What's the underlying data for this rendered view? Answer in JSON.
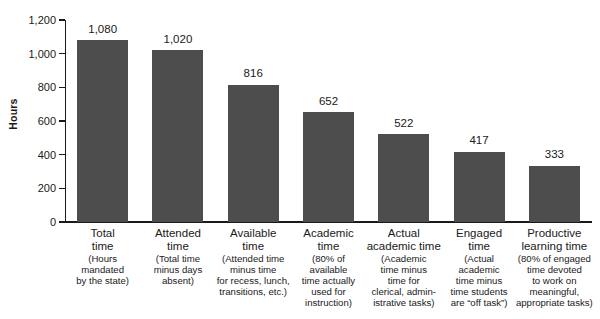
{
  "chart_data": {
    "type": "bar",
    "title": "",
    "xlabel": "",
    "ylabel": "Hours",
    "ylim": [
      0,
      1200
    ],
    "yticks": [
      0,
      200,
      400,
      600,
      800,
      1000,
      1200
    ],
    "ytick_labels": [
      "0",
      "200",
      "400",
      "600",
      "800",
      "1,000",
      "1,200"
    ],
    "grid": false,
    "legend": false,
    "bar_color": "#4d4d4d",
    "categories": [
      "Total time",
      "Attended time",
      "Available time",
      "Academic time",
      "Actual academic time",
      "Engaged time",
      "Productive learning time"
    ],
    "values": [
      1080,
      1020,
      816,
      652,
      522,
      417,
      333
    ],
    "value_labels": [
      "1,080",
      "1,020",
      "816",
      "652",
      "522",
      "417",
      "333"
    ],
    "category_details": [
      {
        "title": "Total\ntime",
        "note": "(Hours\nmandated\nby the state)"
      },
      {
        "title": "Attended\ntime",
        "note": "(Total time\nminus days\nabsent)"
      },
      {
        "title": "Available\ntime",
        "note": "(Attended time\nminus time\nfor recess, lunch,\ntransitions, etc.)"
      },
      {
        "title": "Academic\ntime",
        "note": "(80% of\navailable\ntime actually\nused for\ninstruction)"
      },
      {
        "title": "Actual\nacademic time",
        "note": "(Academic\ntime minus\ntime for\nclerical, admin-\nistrative tasks)"
      },
      {
        "title": "Engaged\ntime",
        "note": "(Actual\nacademic\ntime minus\ntime students\nare “off task”)"
      },
      {
        "title": "Productive\nlearning time",
        "note": "(80% of engaged\ntime devoted\nto work on\nmeaningful,\nappropriate tasks)"
      }
    ]
  }
}
